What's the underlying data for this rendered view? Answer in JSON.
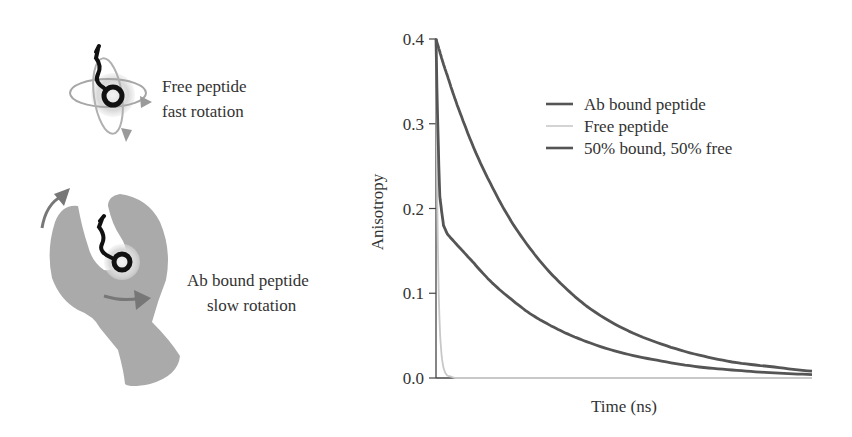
{
  "illustration": {
    "free_label_line1": "Free peptide",
    "free_label_line2": "fast rotation",
    "bound_label_line1": "Ab bound peptide",
    "bound_label_line2": "slow rotation",
    "colors": {
      "antibody": "#a9a9a9",
      "arrow": "#7a7a7a",
      "orbit": "#9a9a9a",
      "fluorophore": "#111111",
      "halo": "#dcdcdc"
    }
  },
  "chart_data": {
    "type": "line",
    "title": "",
    "xlabel": "Time (ns)",
    "ylabel": "Anisotropy",
    "ylim": [
      0.0,
      0.4
    ],
    "yticks": [
      "0.0",
      "0.1",
      "0.2",
      "0.3",
      "0.4"
    ],
    "xticks": [],
    "grid": false,
    "legend_position": "upper right",
    "x": [
      0,
      0.1,
      0.2,
      0.3,
      0.5,
      0.75,
      1,
      1.5,
      2,
      2.5,
      3,
      3.5,
      4,
      5,
      6,
      7,
      8,
      9,
      10
    ],
    "x_units": "arbitrary (unlabeled time axis)",
    "series": [
      {
        "name": "Ab bound peptide",
        "color": "#555555",
        "values": [
          0.4,
          0.385,
          0.37,
          0.357,
          0.33,
          0.3,
          0.272,
          0.225,
          0.185,
          0.153,
          0.126,
          0.104,
          0.085,
          0.058,
          0.04,
          0.027,
          0.018,
          0.013,
          0.008
        ]
      },
      {
        "name": "Free peptide",
        "color": "#c8c8c8",
        "values": [
          0.4,
          0.06,
          0.012,
          0.003,
          0.0,
          0.0,
          0.0,
          0.0,
          0.0,
          0.0,
          0.0,
          0.0,
          0.0,
          0.0,
          0.0,
          0.0,
          0.0,
          0.0,
          0.0
        ]
      },
      {
        "name": "50% bound, 50% free",
        "color": "#555555",
        "values": [
          0.4,
          0.215,
          0.18,
          0.17,
          0.16,
          0.148,
          0.136,
          0.112,
          0.093,
          0.076,
          0.063,
          0.052,
          0.043,
          0.029,
          0.02,
          0.013,
          0.009,
          0.006,
          0.004
        ]
      }
    ]
  }
}
